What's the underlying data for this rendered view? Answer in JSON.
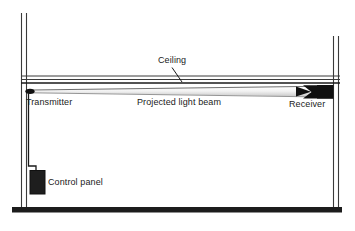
{
  "figure": {
    "kind": "technical-line-diagram",
    "background_color": "#ffffff",
    "line_color": "#1a1a1a",
    "fill_dark": "#101010"
  },
  "labels": {
    "ceiling": "Ceiling",
    "transmitter": "Transmitter",
    "beam": "Projected light beam",
    "receiver": "Receiver",
    "control_panel": "Control panel"
  },
  "components": [
    {
      "id": "left-wall",
      "name": "Left wall",
      "type": "double-line-vertical"
    },
    {
      "id": "right-wall",
      "name": "Right wall",
      "type": "double-line-vertical"
    },
    {
      "id": "ceiling",
      "name": "Ceiling",
      "type": "double-line-horizontal"
    },
    {
      "id": "floor",
      "name": "Floor",
      "type": "thick-bar"
    },
    {
      "id": "transmitter",
      "name": "Transmitter",
      "type": "device-marker"
    },
    {
      "id": "receiver",
      "name": "Receiver",
      "type": "device-marker"
    },
    {
      "id": "light-beam",
      "name": "Projected light beam",
      "type": "tapered-cone"
    },
    {
      "id": "control-panel",
      "name": "Control panel",
      "type": "filled-box"
    },
    {
      "id": "conduit",
      "name": "Conduit run",
      "type": "polyline"
    }
  ]
}
